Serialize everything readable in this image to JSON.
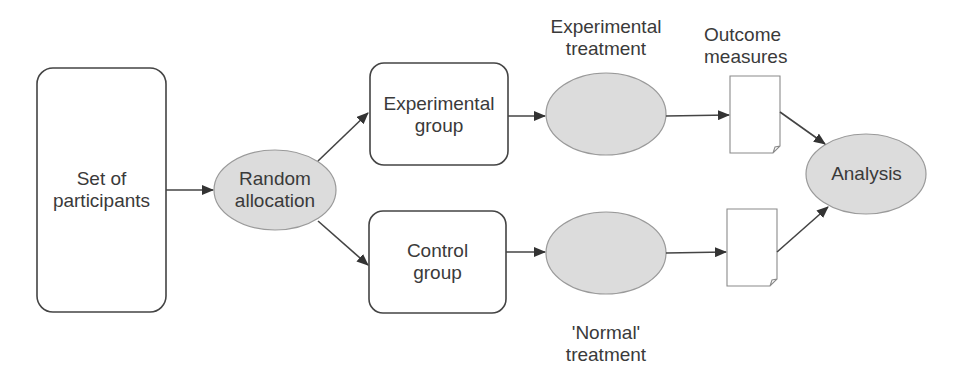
{
  "diagram": {
    "nodes": {
      "participants": {
        "line1": "Set of",
        "line2": "participants"
      },
      "random": {
        "line1": "Random",
        "line2": "allocation"
      },
      "exp_group": {
        "line1": "Experimental",
        "line2": "group"
      },
      "ctrl_group": {
        "line1": "Control",
        "line2": "group"
      },
      "exp_treatment": {
        "line1": "Experimental",
        "line2": "treatment"
      },
      "normal_treatment": {
        "line1": "'Normal'",
        "line2": "treatment"
      },
      "outcome": {
        "line1": "Outcome",
        "line2": "measures"
      },
      "analysis": {
        "label": "Analysis"
      }
    },
    "edges": [
      {
        "from": "participants",
        "to": "random"
      },
      {
        "from": "random",
        "to": "exp_group"
      },
      {
        "from": "random",
        "to": "ctrl_group"
      },
      {
        "from": "exp_group",
        "to": "exp_treatment"
      },
      {
        "from": "ctrl_group",
        "to": "normal_treatment"
      },
      {
        "from": "exp_treatment",
        "to": "outcome_doc_top"
      },
      {
        "from": "normal_treatment",
        "to": "outcome_doc_bottom"
      },
      {
        "from": "outcome_doc_top",
        "to": "analysis"
      },
      {
        "from": "outcome_doc_bottom",
        "to": "analysis"
      }
    ],
    "colors": {
      "stroke": "#444444",
      "ellipse_fill": "#dcdcdc",
      "ellipse_stroke": "#9a9a9a",
      "doc_stroke": "#8a8a8a",
      "text": "#3a3a3a"
    }
  }
}
